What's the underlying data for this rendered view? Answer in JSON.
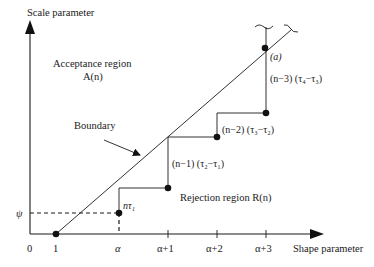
{
  "axes": {
    "y_label": "Scale parameter",
    "x_label": "Shape parameter",
    "origin_label": "0",
    "x_ticks": [
      "1",
      "α",
      "α+1",
      "α+2",
      "α+3"
    ],
    "y_ticks": [
      "ψ"
    ]
  },
  "regions": {
    "acceptance_line1": "Acceptance region",
    "acceptance_line2": "A(n)",
    "rejection": "Rejection region R(n)"
  },
  "boundary_label": "Boundary",
  "step_labels": {
    "s1": "nτ₁",
    "s2": "(n−1) (τ₂−τ₁)",
    "s3": "(n−2) (τ₃−τ₂)",
    "s4": "(n−3) (τ₄−τ₃)"
  },
  "point_label_a": "(a)",
  "colors": {
    "ink": "#1a1a1a",
    "background": "#ffffff"
  }
}
